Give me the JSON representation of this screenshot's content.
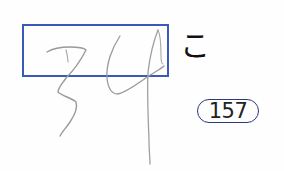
{
  "worksheet": {
    "answer_box": {
      "handwritten_text": "34",
      "border_color": "#3a5bb5"
    },
    "okurigana": "こ",
    "question_number": "157"
  },
  "colors": {
    "box_border": "#3a5bb5",
    "pencil_stroke": "#9a9a9a",
    "text": "#111111",
    "badge_border": "#2a3a7a"
  }
}
